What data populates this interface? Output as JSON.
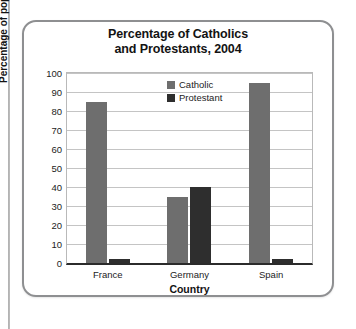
{
  "chart_data": {
    "type": "bar",
    "title": "Percentage of Catholics and Protestants, 2004",
    "title_line1": "Percentage of Catholics",
    "title_line2": "and Protestants, 2004",
    "xlabel": "Country",
    "ylabel": "Percentage of population",
    "categories": [
      "France",
      "Germany",
      "Spain"
    ],
    "series": [
      {
        "name": "Catholic",
        "color": "#6e6e6e",
        "values": [
          85,
          35,
          95
        ]
      },
      {
        "name": "Protestant",
        "color": "#2e2e2e",
        "values": [
          2,
          40,
          2
        ]
      }
    ],
    "ylim": [
      0,
      100
    ],
    "yticks": [
      "100",
      "90",
      "80",
      "70",
      "60",
      "50",
      "40",
      "30",
      "20",
      "10",
      "0"
    ],
    "grid": true,
    "legend_position": "inside-top-center"
  }
}
